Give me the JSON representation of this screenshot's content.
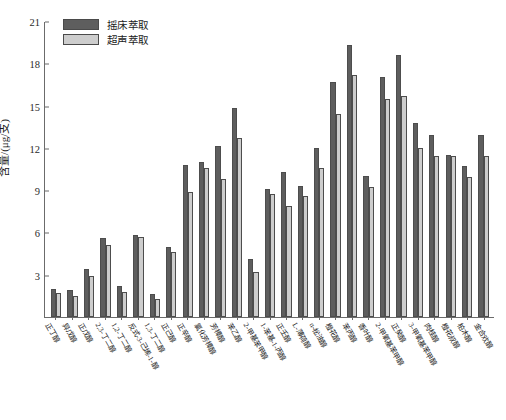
{
  "chart_data": {
    "type": "bar",
    "title": "",
    "xlabel": "",
    "ylabel": "含量/(μg/支)",
    "ylim": [
      0,
      21
    ],
    "yticks": [
      0,
      3,
      6,
      9,
      12,
      15,
      18,
      21
    ],
    "ytick_labels": [
      "",
      "3",
      "6",
      "9",
      "12",
      "15",
      "18",
      "21"
    ],
    "grid": false,
    "legend_position": "top-left",
    "colors": {
      "series_1": "#5e5e5e",
      "series_2": "#cdcdcd",
      "axis": "#6b6b6b",
      "text": "#1a1a1a"
    },
    "categories": [
      "正丁醇",
      "异戊醇",
      "正戊醇",
      "2,3-丁二醇",
      "1,2-丁二醇",
      "反式-3-己烯-1-醇",
      "1,3-丁二醇",
      "正己醇",
      "正辛醇",
      "氯化芳樟醇",
      "芳樟醇",
      "苯乙醇",
      "2-甲基苯甲醇",
      "1-苯基-1-丙醇",
      "正壬醇",
      "L-薄荷醇",
      "α-松油醇",
      "橙花醇",
      "苯丙醇",
      "香叶醇",
      "2-甲氧基苯甲醇",
      "正癸醇",
      "3-甲氧基苯甲醇",
      "肉桂醇",
      "橙花叔醇",
      "柏木醇",
      "金合欢醇"
    ],
    "series": [
      {
        "name": "摇床萃取",
        "color": "#5e5e5e",
        "values": [
          2.0,
          1.9,
          3.4,
          5.6,
          2.2,
          5.8,
          1.6,
          5.0,
          10.8,
          11.0,
          12.1,
          14.8,
          4.1,
          9.1,
          10.3,
          9.3,
          12.0,
          16.7,
          19.3,
          10.0,
          17.0,
          18.6,
          13.8,
          12.9,
          11.5,
          10.7,
          12.9
        ],
        "unit": "μg/支"
      },
      {
        "name": "超声萃取",
        "color": "#cdcdcd",
        "values": [
          1.7,
          1.5,
          2.9,
          5.1,
          1.8,
          5.7,
          1.3,
          4.6,
          8.9,
          10.6,
          9.8,
          12.7,
          3.2,
          8.7,
          7.9,
          8.6,
          10.6,
          14.4,
          17.2,
          9.2,
          15.5,
          15.7,
          12.0,
          11.4,
          11.4,
          9.9,
          11.4
        ],
        "unit": "μg/支"
      }
    ]
  },
  "legend": {
    "items": [
      {
        "label": "摇床萃取",
        "color": "#5e5e5e"
      },
      {
        "label": "超声萃取",
        "color": "#cdcdcd"
      }
    ]
  },
  "axes": {
    "y_label": "含量/(μg/支)",
    "y_ticks": [
      "21",
      "18",
      "15",
      "12",
      "9",
      "6",
      "3"
    ]
  },
  "caption": ""
}
